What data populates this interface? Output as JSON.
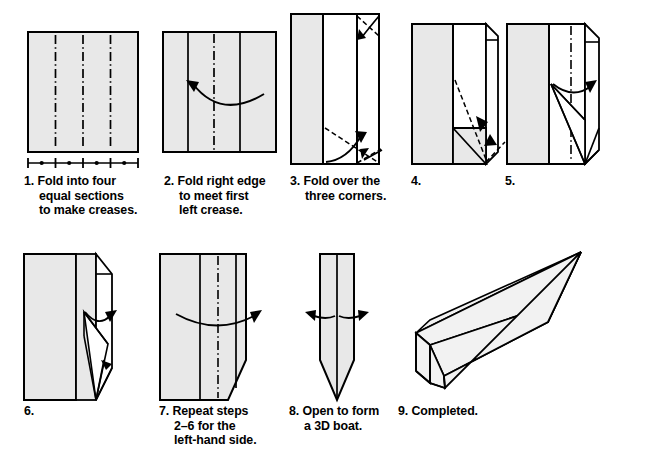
{
  "document": {
    "kind": "origami-instruction-diagram",
    "title": "Paper boat folding instructions",
    "background_color": "#ffffff",
    "ink_color": "#000000",
    "paper_fill": "#e8e8e8",
    "paper_fill_light": "#f2f2f2"
  },
  "steps": [
    {
      "number": "1.",
      "caption_lines": [
        "Fold into four",
        "equal sections",
        "to make creases."
      ],
      "figure": "square-with-three-creases-and-measure-bar"
    },
    {
      "number": "2.",
      "caption_lines": [
        "Fold right edge",
        "to meet first",
        "left crease."
      ],
      "figure": "rectangle-with-curved-arrow-left"
    },
    {
      "number": "3.",
      "caption_lines": [
        "Fold over the",
        "three corners."
      ],
      "figure": "tall-panel-with-corner-fold-arrows"
    },
    {
      "number": "4.",
      "caption_lines": [],
      "figure": "panel-with-folded-corners-and-dashed-diagonals"
    },
    {
      "number": "5.",
      "caption_lines": [],
      "figure": "panel-with-center-crease-and-curved-arrow"
    },
    {
      "number": "6.",
      "caption_lines": [],
      "figure": "panel-with-pointed-bottom-and-arrow"
    },
    {
      "number": "7.",
      "caption_lines": [
        "Repeat steps",
        "2–6 for the",
        "left-hand side."
      ],
      "figure": "wide-panel-with-center-crease-and-right-arrow"
    },
    {
      "number": "8.",
      "caption_lines": [
        "Open to form",
        "a 3D boat."
      ],
      "figure": "narrow-pointed-shape-with-spreading-arrows"
    },
    {
      "number": "9.",
      "caption_lines": [
        "Completed."
      ],
      "figure": "completed-3d-boat"
    }
  ]
}
